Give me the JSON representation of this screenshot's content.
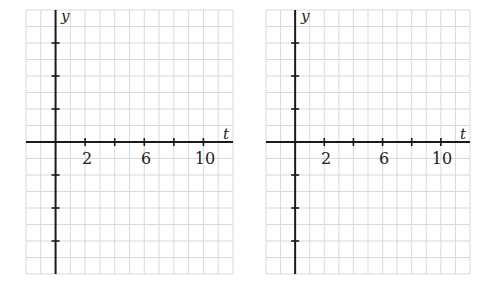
{
  "chart_data": [
    {
      "type": "line",
      "title": "",
      "xlabel": "t",
      "ylabel": "y",
      "xlim": [
        -2,
        12
      ],
      "ylim": [
        -4,
        4
      ],
      "x_tick_positions": [
        2,
        4,
        6,
        8,
        10
      ],
      "x_tick_labels": [
        "2",
        "",
        "6",
        "",
        "10"
      ],
      "y_tick_positions": [
        -3,
        -2,
        -1,
        1,
        2,
        3
      ],
      "y_tick_labels": [
        "",
        "",
        "",
        "",
        "",
        ""
      ],
      "grid": true,
      "series": []
    },
    {
      "type": "line",
      "title": "",
      "xlabel": "t",
      "ylabel": "y",
      "xlim": [
        -2,
        12
      ],
      "ylim": [
        -4,
        4
      ],
      "x_tick_positions": [
        2,
        4,
        6,
        8,
        10
      ],
      "x_tick_labels": [
        "2",
        "",
        "6",
        "",
        "10"
      ],
      "y_tick_positions": [
        -3,
        -2,
        -1,
        1,
        2,
        3
      ],
      "y_tick_labels": [
        "",
        "",
        "",
        "",
        "",
        ""
      ],
      "grid": true,
      "series": []
    }
  ],
  "plots": [
    {
      "x_axis_label": "t",
      "y_axis_label": "y",
      "tick_labels": [
        "2",
        "6",
        "10"
      ]
    },
    {
      "x_axis_label": "t",
      "y_axis_label": "y",
      "tick_labels": [
        "2",
        "6",
        "10"
      ]
    }
  ],
  "colors": {
    "grid": "#d9d9d9",
    "axis": "#1a1a1a",
    "background": "#ffffff"
  }
}
